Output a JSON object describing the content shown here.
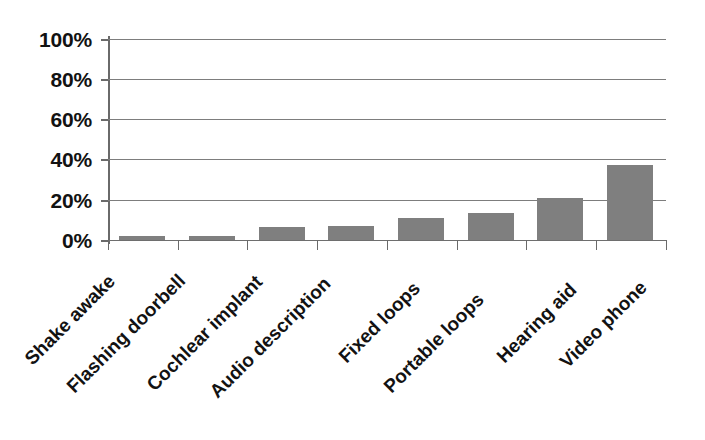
{
  "chart_data": {
    "type": "bar",
    "title": "",
    "subtitle": "",
    "xlabel": "",
    "ylabel": "",
    "categories": [
      "Shake awake",
      "Flashing doorbell",
      "Cochlear implant",
      "Audio description",
      "Fixed loops",
      "Portable loops",
      "Hearing aid",
      "Video phone"
    ],
    "values": [
      2,
      2,
      6.5,
      7,
      11,
      13.5,
      21,
      37.5
    ],
    "value_suffix": "%",
    "ylim": [
      0,
      100
    ],
    "ytick_values": [
      0,
      20,
      40,
      60,
      80,
      100
    ],
    "ytick_labels": [
      "0%",
      "20%",
      "40%",
      "60%",
      "80%",
      "100%"
    ],
    "grid": true,
    "grid_axis": "y",
    "legend": false,
    "legend_position": "none",
    "series": [
      {
        "name": "",
        "color": "#7f7f7f",
        "values": [
          2,
          2,
          6.5,
          7,
          11,
          13.5,
          21,
          37.5
        ]
      }
    ]
  },
  "style": {
    "bar_color": "#7f7f7f",
    "gridline_color": "#7d7d7d",
    "axis_color": "#6a6a6a",
    "text_color": "#121212",
    "background": "#ffffff",
    "label_rotation_deg": -45
  }
}
